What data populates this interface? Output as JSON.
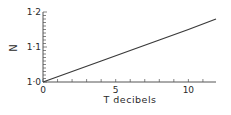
{
  "chart_data": {
    "type": "line",
    "title": "",
    "xlabel": "T decibels",
    "ylabel": "N",
    "xlim": [
      0,
      11.9
    ],
    "ylim": [
      1.0,
      1.2
    ],
    "x_ticks": [
      0,
      5,
      10
    ],
    "x_tick_labels": [
      "0",
      "5",
      "10"
    ],
    "x_minor_step": 1,
    "y_ticks": [
      1.0,
      1.1,
      1.2
    ],
    "y_tick_labels": [
      "1·0",
      "1·1",
      "1·2"
    ],
    "y_minor_step": 0.01,
    "grid": false,
    "legend": null,
    "series": [
      {
        "name": "N vs T",
        "x": [
          0,
          2,
          4,
          6,
          8,
          10,
          11.9
        ],
        "y": [
          1.0,
          1.03,
          1.06,
          1.09,
          1.12,
          1.15,
          1.18
        ]
      }
    ],
    "colors": {
      "line": "#3a3a3a",
      "axis": "#555555"
    }
  }
}
